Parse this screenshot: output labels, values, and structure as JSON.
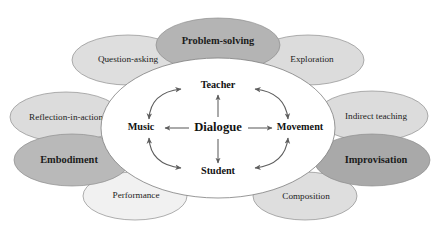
{
  "diagram": {
    "background_color": "#ffffff",
    "hub": {
      "center_label": "Dialogue",
      "nodes": [
        {
          "id": "teacher",
          "label": "Teacher",
          "position": "top"
        },
        {
          "id": "movement",
          "label": "Movement",
          "position": "right"
        },
        {
          "id": "student",
          "label": "Student",
          "position": "bottom"
        },
        {
          "id": "music",
          "label": "Music",
          "position": "left"
        }
      ],
      "spoke_arrows": [
        {
          "from": "Dialogue",
          "to": "Teacher",
          "style": "single-headed"
        },
        {
          "from": "Dialogue",
          "to": "Movement",
          "style": "single-headed"
        },
        {
          "from": "Dialogue",
          "to": "Student",
          "style": "single-headed"
        },
        {
          "from": "Dialogue",
          "to": "Music",
          "style": "single-headed"
        }
      ],
      "curved_arrows": [
        {
          "between": [
            "Music",
            "Teacher"
          ],
          "style": "double-headed",
          "quadrant": "top-left"
        },
        {
          "between": [
            "Teacher",
            "Movement"
          ],
          "style": "double-headed",
          "quadrant": "top-right"
        },
        {
          "between": [
            "Music",
            "Student"
          ],
          "style": "double-headed",
          "quadrant": "bottom-left"
        },
        {
          "between": [
            "Student",
            "Movement"
          ],
          "style": "double-headed",
          "quadrant": "bottom-right"
        }
      ]
    },
    "ellipses": [
      {
        "id": "question-asking",
        "label": "Question-asking",
        "emphasis": "regular",
        "fill": "#dedede"
      },
      {
        "id": "problem-solving",
        "label": "Problem-solving",
        "emphasis": "bold",
        "fill": "#b4b4b4"
      },
      {
        "id": "exploration",
        "label": "Exploration",
        "emphasis": "regular",
        "fill": "#dcdcdc"
      },
      {
        "id": "indirect-teaching",
        "label": "Indirect teaching",
        "emphasis": "regular",
        "fill": "#dcdcdc"
      },
      {
        "id": "improvisation",
        "label": "Improvisation",
        "emphasis": "bold",
        "fill": "#a9a9a9"
      },
      {
        "id": "composition",
        "label": "Composition",
        "emphasis": "regular",
        "fill": "#dedede"
      },
      {
        "id": "performance",
        "label": "Performance",
        "emphasis": "regular",
        "fill": "#f1f1f1"
      },
      {
        "id": "embodiment",
        "label": "Embodiment",
        "emphasis": "bold",
        "fill": "#b9b9b9"
      },
      {
        "id": "reflection-in-action",
        "label": "Reflection-in-action",
        "emphasis": "regular",
        "fill": "#dcdcdc"
      }
    ]
  }
}
